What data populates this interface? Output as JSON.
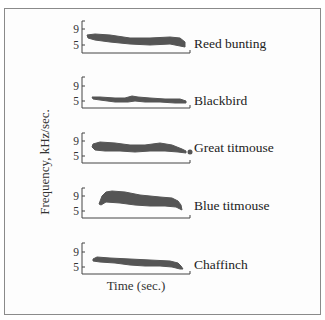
{
  "figure": {
    "y_axis_label": "Frequency, kHz/sec.",
    "x_axis_label": "Time (sec.)",
    "blob_color": "#555555",
    "axis_color": "#444444"
  },
  "panels": [
    {
      "species": "Reed bunting",
      "tick_9": "9",
      "tick_5": "5",
      "top": 21,
      "y9": 29,
      "y5": 45,
      "base": 53,
      "label_y": 44,
      "shape": "87,35 95,34 110,35 130,38 150,38 170,37 180,38 185,42 185,47 180,46 170,44 150,45 130,44 110,42 95,40 88,38",
      "end_dot": null
    },
    {
      "species": "Blackbird",
      "tick_9": "9",
      "tick_5": "5",
      "top": 77,
      "y9": 86,
      "y5": 101,
      "base": 108,
      "label_y": 101,
      "shape": "92,97 100,97 115,98 125,98 132,96 138,97 150,98 165,99 180,99 186,101 186,103 175,103 160,102 145,102 135,101 128,102 115,102 100,100 93,99",
      "end_dot": null
    },
    {
      "species": "Great titmouse",
      "tick_9": "9",
      "tick_5": "5",
      "top": 133,
      "y9": 141,
      "y5": 156,
      "base": 163,
      "label_y": 148,
      "shape": "93,144 100,142 115,143 130,145 145,145 160,143 172,145 182,149 186,151 186,153 178,152 165,151 150,151 135,152 120,151 105,151 95,150 92,147",
      "end_dot": {
        "cx": 190,
        "cy": 152,
        "r": 2.5
      }
    },
    {
      "species": "Blue titmouse",
      "tick_9": "9",
      "tick_5": "5",
      "top": 188,
      "y9": 196,
      "y5": 211,
      "base": 218,
      "label_y": 206,
      "shape": "99,204 102,196 106,192 112,191 125,192 140,195 160,197 172,198 178,201 181,205 182,210 176,207 165,206 150,206 135,205 120,203 106,202 101,205",
      "end_dot": null
    },
    {
      "species": "Chaffinch",
      "tick_9": "9",
      "tick_5": "5",
      "top": 243,
      "y9": 252,
      "y5": 267,
      "base": 274,
      "label_y": 265,
      "shape": "93,259 97,257 110,258 130,259 150,260 170,261 178,263 181,266 183,269 180,269 172,267 160,266 145,266 130,265 115,263 100,262 93,261",
      "end_dot": null
    }
  ]
}
